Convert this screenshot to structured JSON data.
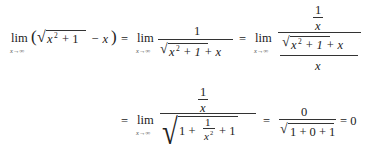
{
  "equation": {
    "line1": {
      "lim": "lim",
      "sub": "x→∞",
      "lparen": "(",
      "radical": "√",
      "x": "x",
      "sq": "2",
      "plus1": "+ 1",
      "minus_x": "− x",
      "rparen": ")",
      "eq": "=",
      "term2_num": "1",
      "term2_den_x": "x",
      "term2_den_sq": "2",
      "term2_den_rest": "+ 1 + x",
      "term3_num_top": "1",
      "term3_num_bot": "x",
      "term3_den_top_x": "x",
      "term3_den_top_sq": "2",
      "term3_den_top_rest": "+ 1 + x",
      "term3_den_bot": "x"
    },
    "line2": {
      "eq": "=",
      "lim": "lim",
      "sub": "x→∞",
      "num_top": "1",
      "num_bot": "x",
      "den_one": "1 +",
      "den_frac_num": "1",
      "den_frac_den": "x",
      "den_frac_sq": "2",
      "den_rest": "+ 1",
      "eq2": "=",
      "res_num": "0",
      "res_den": "1 + 0 + 1",
      "eq3": "= 0"
    }
  }
}
